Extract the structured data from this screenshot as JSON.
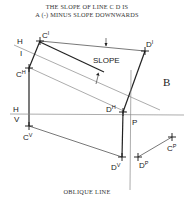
{
  "title": {
    "line1": "THE SLOPE OF LINE C D IS",
    "line2": "A (-) MINUS SLOPE DOWNWARDS"
  },
  "caption": "OBLIQUE LINE",
  "labels": {
    "slope": "SLOPE",
    "aux_view": "B",
    "fold_h_top": "H",
    "fold_aux": "I",
    "fold_h_bottom": "H",
    "fold_v": "V",
    "fold_p": "P"
  },
  "points": {
    "c_prime": {
      "base": "C",
      "sup": "I"
    },
    "d_prime": {
      "base": "D",
      "sup": "I"
    },
    "c_h": {
      "base": "C",
      "sup": "H"
    },
    "d_h": {
      "base": "D",
      "sup": "H"
    },
    "c_v": {
      "base": "C",
      "sup": "V"
    },
    "d_v": {
      "base": "D",
      "sup": "V"
    },
    "c_p": {
      "base": "C",
      "sup": "P"
    },
    "d_p": {
      "base": "D",
      "sup": "P"
    }
  }
}
